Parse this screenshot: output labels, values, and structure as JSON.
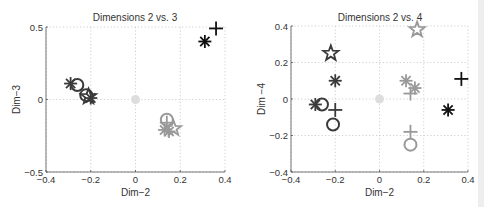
{
  "chart_data": [
    {
      "type": "scatter",
      "title": "Dimensions 2 vs. 3",
      "xlabel": "Dim−2",
      "ylabel": "Dim−3",
      "xlim": [
        -0.4,
        0.4
      ],
      "ylim": [
        -0.5,
        0.5
      ],
      "xticks": [
        "−0.4",
        "−0.2",
        "0",
        "0.2",
        "0.4"
      ],
      "xtick_values": [
        -0.4,
        -0.2,
        0,
        0.2,
        0.4
      ],
      "yticks": [
        "−0.5",
        "0",
        "0.5"
      ],
      "ytick_values": [
        -0.5,
        0,
        0.5
      ],
      "grid": true,
      "points": [
        {
          "x": -0.29,
          "y": 0.11,
          "marker": "asterisk",
          "color": "#3a3a3a"
        },
        {
          "x": -0.26,
          "y": 0.1,
          "marker": "circle",
          "color": "#3a3a3a"
        },
        {
          "x": -0.22,
          "y": 0.03,
          "marker": "circle",
          "color": "#3a3a3a"
        },
        {
          "x": -0.21,
          "y": 0.02,
          "marker": "star",
          "color": "#3a3a3a"
        },
        {
          "x": -0.2,
          "y": 0.01,
          "marker": "asterisk",
          "color": "#3a3a3a"
        },
        {
          "x": 0.0,
          "y": 0.0,
          "marker": "dot",
          "color": "#dddddd"
        },
        {
          "x": 0.14,
          "y": -0.14,
          "marker": "circle",
          "color": "#999999"
        },
        {
          "x": 0.14,
          "y": -0.16,
          "marker": "plus",
          "color": "#999999"
        },
        {
          "x": 0.13,
          "y": -0.21,
          "marker": "asterisk",
          "color": "#999999"
        },
        {
          "x": 0.17,
          "y": -0.2,
          "marker": "star",
          "color": "#999999"
        },
        {
          "x": 0.15,
          "y": -0.22,
          "marker": "asterisk",
          "color": "#999999"
        },
        {
          "x": 0.31,
          "y": 0.4,
          "marker": "asterisk",
          "color": "#111111"
        },
        {
          "x": 0.36,
          "y": 0.49,
          "marker": "plus",
          "color": "#111111"
        }
      ]
    },
    {
      "type": "scatter",
      "title": "Dimensions 2 vs. 4",
      "xlabel": "Dim−2",
      "ylabel": "Dim −4",
      "xlim": [
        -0.4,
        0.4
      ],
      "ylim": [
        -0.4,
        0.4
      ],
      "xticks": [
        "−0.4",
        "−0.2",
        "0",
        "0.2",
        "0.4"
      ],
      "xtick_values": [
        -0.4,
        -0.2,
        0,
        0.2,
        0.4
      ],
      "yticks": [
        "−0.4",
        "−0.2",
        "0",
        "0.2",
        "0.4"
      ],
      "ytick_values": [
        -0.4,
        -0.2,
        0,
        0.2,
        0.4
      ],
      "grid": true,
      "points": [
        {
          "x": -0.22,
          "y": 0.25,
          "marker": "star",
          "color": "#3a3a3a"
        },
        {
          "x": -0.2,
          "y": 0.1,
          "marker": "asterisk",
          "color": "#3a3a3a"
        },
        {
          "x": -0.29,
          "y": -0.03,
          "marker": "asterisk",
          "color": "#3a3a3a"
        },
        {
          "x": -0.26,
          "y": -0.03,
          "marker": "circle",
          "color": "#3a3a3a"
        },
        {
          "x": -0.2,
          "y": -0.06,
          "marker": "plus",
          "color": "#3a3a3a"
        },
        {
          "x": -0.21,
          "y": -0.14,
          "marker": "circle",
          "color": "#3a3a3a"
        },
        {
          "x": 0.0,
          "y": 0.0,
          "marker": "dot",
          "color": "#dddddd"
        },
        {
          "x": 0.17,
          "y": 0.38,
          "marker": "star",
          "color": "#999999"
        },
        {
          "x": 0.12,
          "y": 0.1,
          "marker": "asterisk",
          "color": "#999999"
        },
        {
          "x": 0.16,
          "y": 0.06,
          "marker": "asterisk",
          "color": "#999999"
        },
        {
          "x": 0.14,
          "y": 0.03,
          "marker": "plus",
          "color": "#999999"
        },
        {
          "x": 0.14,
          "y": -0.18,
          "marker": "plus",
          "color": "#999999"
        },
        {
          "x": 0.14,
          "y": -0.25,
          "marker": "circle",
          "color": "#999999"
        },
        {
          "x": 0.37,
          "y": 0.11,
          "marker": "plus",
          "color": "#111111"
        },
        {
          "x": 0.31,
          "y": -0.06,
          "marker": "asterisk",
          "color": "#111111"
        }
      ]
    }
  ],
  "layout": [
    {
      "left": 46,
      "right": 225,
      "top": 27,
      "bottom": 172,
      "title_x": 135,
      "title_y": 15
    },
    {
      "left": 291,
      "right": 468,
      "top": 26,
      "bottom": 172,
      "title_x": 380,
      "title_y": 15
    }
  ]
}
